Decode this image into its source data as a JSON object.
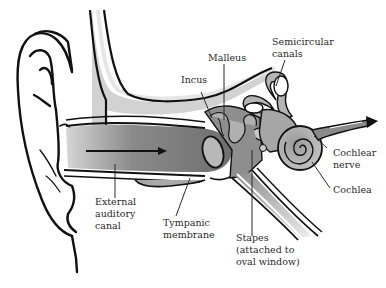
{
  "diagram": {
    "colors": {
      "outline": "#111111",
      "canal_fill": "#7a7a7a",
      "light_fill": "#c8c8c8",
      "mid_fill": "#9a9a9a",
      "background": "#ffffff",
      "label_text": "#2a2a2a"
    },
    "labels": {
      "malleus": "Malleus",
      "incus": "Incus",
      "semicircular_canals": [
        "Semicircular",
        "canals"
      ],
      "cochlear_nerve": [
        "Cochlear",
        "nerve"
      ],
      "cochlea": "Cochlea",
      "external_auditory_canal": [
        "External",
        "auditory",
        "canal"
      ],
      "tympanic_membrane": [
        "Tympanic",
        "membrane"
      ],
      "stapes": [
        "Stapes",
        "(attached to",
        "oval window)"
      ]
    }
  }
}
